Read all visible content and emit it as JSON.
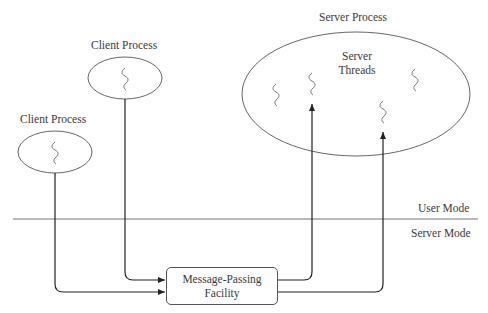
{
  "diagram": {
    "client_process_upper": {
      "label": "Client Process"
    },
    "client_process_lower": {
      "label": "Client Process"
    },
    "server_process": {
      "label": "Server Process",
      "inner_label_line1": "Server",
      "inner_label_line2": "Threads"
    },
    "modes": {
      "user": "User Mode",
      "server": "Server Mode"
    },
    "facility": {
      "line1": "Message-Passing",
      "line2": "Facility"
    },
    "icons": {
      "thread": "thread-squiggle-icon",
      "arrow": "arrowhead-icon"
    },
    "colors": {
      "stroke": "#333333",
      "thread": "#666666",
      "text": "#3a3a3a"
    }
  }
}
